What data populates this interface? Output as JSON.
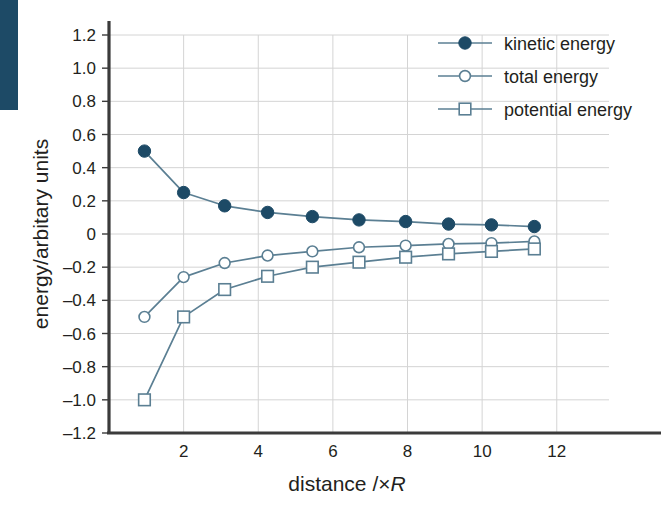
{
  "figure": {
    "background_color": "#ffffff",
    "decor_bar_color": "#1d4a66",
    "accent_color": "#1d4a66",
    "line_color": "#5b7f93",
    "grid_color": "#d4d4d4",
    "axis_color": "#3b3b3b"
  },
  "axes": {
    "x_title_prefix": "distance /×",
    "x_title_italic": "R",
    "x_title_full": "distance /×R",
    "y_title": "energy/arbitary units",
    "x_ticks": [
      "2",
      "4",
      "6",
      "8",
      "10",
      "12"
    ],
    "x_tick_values": [
      2,
      4,
      6,
      8,
      10,
      12
    ],
    "y_ticks": [
      "1.2",
      "1.0",
      "0.8",
      "0.6",
      "0.4",
      "0.2",
      "0",
      "–0.2",
      "–0.4",
      "–0.6",
      "–0.8",
      "–1.0",
      "–1.2"
    ],
    "y_tick_values": [
      1.2,
      1.0,
      0.8,
      0.6,
      0.4,
      0.2,
      0,
      -0.2,
      -0.4,
      -0.6,
      -0.8,
      -1.0,
      -1.2
    ]
  },
  "legend": {
    "position": "top-right",
    "items": [
      {
        "label": "kinetic energy",
        "marker": "filled-circle",
        "color": "#1d4a66"
      },
      {
        "label": "total energy",
        "marker": "open-circle",
        "color": "#5b7f93"
      },
      {
        "label": "potential energy",
        "marker": "open-square",
        "color": "#5b7f93"
      }
    ]
  },
  "chart_data": {
    "type": "line",
    "title": "",
    "xlabel": "distance /×R",
    "ylabel": "energy/arbitary units",
    "xlim": [
      0,
      13.4
    ],
    "ylim": [
      -1.2,
      1.2
    ],
    "grid": true,
    "legend_position": "top-right",
    "x": [
      0.95,
      2.0,
      3.1,
      4.25,
      5.45,
      6.7,
      7.95,
      9.1,
      10.25,
      11.4
    ],
    "series": [
      {
        "name": "kinetic energy",
        "marker": "filled-circle",
        "color": "#1d4a66",
        "values": [
          0.5,
          0.25,
          0.17,
          0.13,
          0.105,
          0.085,
          0.075,
          0.06,
          0.055,
          0.045
        ]
      },
      {
        "name": "total energy",
        "marker": "open-circle",
        "color": "#5b7f93",
        "values": [
          -0.5,
          -0.26,
          -0.175,
          -0.13,
          -0.105,
          -0.08,
          -0.07,
          -0.06,
          -0.055,
          -0.045
        ]
      },
      {
        "name": "potential energy",
        "marker": "open-square",
        "color": "#5b7f93",
        "values": [
          -1.0,
          -0.5,
          -0.335,
          -0.255,
          -0.2,
          -0.17,
          -0.14,
          -0.12,
          -0.105,
          -0.09
        ]
      }
    ]
  }
}
